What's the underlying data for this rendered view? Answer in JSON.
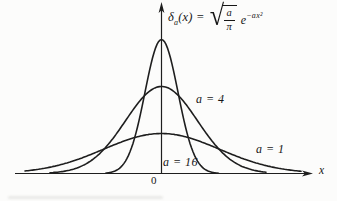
{
  "figure": {
    "background": "#fcfcfb",
    "formula": {
      "delta": "δ",
      "subscript": "a",
      "lhs_rest": "(x) =",
      "radical_sign": "√",
      "numerator": "a",
      "denominator": "π",
      "exp_base": "e",
      "exponent": "−ax²"
    },
    "labels": {
      "a16": "a = 16",
      "a4": "a = 4",
      "a1": "a = 1",
      "origin": "0",
      "x_axis": "x"
    }
  },
  "chart_data": {
    "type": "line",
    "function": "δ_a(x) = √(a/π) · e^(−a·x²)",
    "x_axis_label": "x",
    "origin_label": "0",
    "grid": false,
    "legend": "inline labels next to each curve",
    "x_range_approx": [
      -3,
      3
    ],
    "series": [
      {
        "name": "a = 16",
        "a": 16,
        "peak_value": 2.26,
        "shape": "tall narrow gaussian"
      },
      {
        "name": "a = 4",
        "a": 4,
        "peak_value": 1.13,
        "shape": "medium gaussian"
      },
      {
        "name": "a = 1",
        "a": 1,
        "peak_value": 0.56,
        "shape": "low wide gaussian"
      }
    ],
    "render": {
      "stroke": "#1e1e1e",
      "stroke_width": 1.6,
      "axis_stroke_width": 1.2,
      "axis_x": 161.5,
      "baseline_y": 173.5,
      "curves": [
        {
          "a": 16,
          "peak_px": 134,
          "sigma_px": 16.5,
          "x_start": 106,
          "x_end": 219
        },
        {
          "a": 4,
          "peak_px": 87,
          "sigma_px": 36,
          "x_start": 50,
          "x_end": 267
        },
        {
          "a": 1,
          "peak_px": 40,
          "sigma_px": 58,
          "x_start": 25,
          "x_end": 301
        }
      ]
    }
  }
}
